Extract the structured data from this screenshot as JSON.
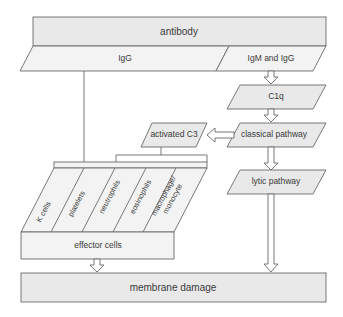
{
  "nodes": {
    "antibody": "antibody",
    "igg": "IgG",
    "igm_igg": "IgM and IgG",
    "c1q": "C1q",
    "classical_pathway": "classical pathway",
    "activated_c3": "activated C3",
    "lytic_pathway": "lytic pathway",
    "effector_cells": "effector cells",
    "membrane_damage": "membrane damage"
  },
  "cell_types": [
    {
      "line1": "K cells",
      "line2": ""
    },
    {
      "line1": "platelets",
      "line2": ""
    },
    {
      "line1": "neutrophils",
      "line2": ""
    },
    {
      "line1": "eosinophils",
      "line2": ""
    },
    {
      "line1": "macrophage/",
      "line2": "monocyte"
    }
  ],
  "colors": {
    "box_fill": "#e9e9e9",
    "stroke": "#6a6a6a",
    "text": "#3a3a3a"
  }
}
